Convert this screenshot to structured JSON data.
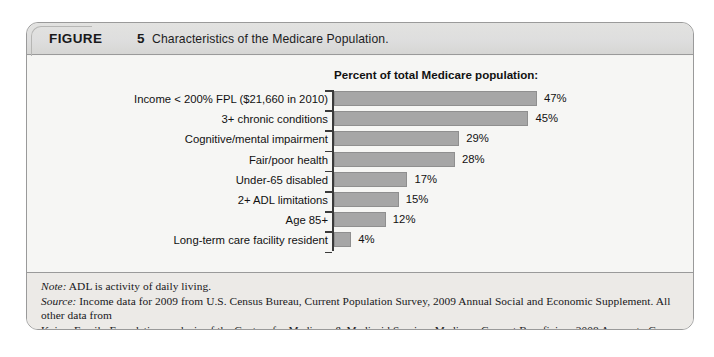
{
  "figure": {
    "label": "FIGURE",
    "number": "5",
    "caption": "Characteristics of the Medicare Population."
  },
  "chart_data": {
    "type": "bar",
    "orientation": "horizontal",
    "title": "Percent of total Medicare population:",
    "xlabel": "",
    "ylabel": "",
    "xlim": [
      0,
      50
    ],
    "grid": false,
    "legend": "none",
    "categories": [
      "Income < 200% FPL ($21,660 in 2010)",
      "3+ chronic conditions",
      "Cognitive/mental impairment",
      "Fair/poor health",
      "Under-65 disabled",
      "2+ ADL limitations",
      "Age 85+",
      "Long-term care facility resident"
    ],
    "values": [
      47,
      45,
      29,
      28,
      17,
      15,
      12,
      4
    ],
    "value_labels": [
      "47%",
      "45%",
      "29%",
      "28%",
      "17%",
      "15%",
      "12%",
      "4%"
    ],
    "bar_color": "#a6a6a6"
  },
  "notes": {
    "note_lead": "Note:",
    "note_text": " ADL is activity of daily living.",
    "source_lead": "Source:",
    "source_line1": " Income data for 2009 from U.S. Census Bureau, Current Population Survey, 2009 Annual Social and Economic Supplement. All other data from",
    "source_line2": "Kaiser Family Foundation analysis of the Centers for Medicare & Medicaid Services Medicare Current Beneficiary 2008 Access to Care file."
  }
}
